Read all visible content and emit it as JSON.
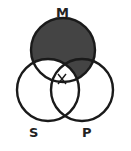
{
  "diagram": {
    "type": "venn",
    "circles": [
      {
        "id": "M",
        "label": "M",
        "cx": 63,
        "cy": 50,
        "r": 32
      },
      {
        "id": "S",
        "label": "S",
        "cx": 48,
        "cy": 90,
        "r": 31
      },
      {
        "id": "P",
        "label": "P",
        "cx": 82,
        "cy": 90,
        "r": 31
      }
    ],
    "shaded_regions": [
      "M only",
      "M and P only"
    ],
    "marked_regions": [
      "M and S and P (x mark)"
    ],
    "colors": {
      "shade": "#444444",
      "stroke": "#1a1a1a",
      "background": "#ffffff"
    }
  },
  "labels": {
    "m": "M",
    "s": "S",
    "p": "P"
  }
}
